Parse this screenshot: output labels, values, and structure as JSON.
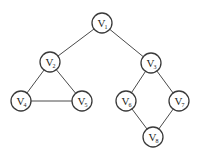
{
  "diagram": {
    "type": "undirected-graph",
    "node_radius": 10,
    "nodes": [
      {
        "id": "V1",
        "letter": "V",
        "sub": "1",
        "x": 102,
        "y": 23
      },
      {
        "id": "V2",
        "letter": "V",
        "sub": "2",
        "x": 50,
        "y": 62
      },
      {
        "id": "V3",
        "letter": "V",
        "sub": "3",
        "x": 151,
        "y": 63
      },
      {
        "id": "V4",
        "letter": "V",
        "sub": "4",
        "x": 21,
        "y": 101
      },
      {
        "id": "V5",
        "letter": "V",
        "sub": "5",
        "x": 82,
        "y": 101
      },
      {
        "id": "V6",
        "letter": "V",
        "sub": "6",
        "x": 126,
        "y": 101
      },
      {
        "id": "V7",
        "letter": "V",
        "sub": "7",
        "x": 179,
        "y": 101
      },
      {
        "id": "V8",
        "letter": "V",
        "sub": "8",
        "x": 153,
        "y": 137
      }
    ],
    "edges": [
      [
        "V1",
        "V2"
      ],
      [
        "V1",
        "V3"
      ],
      [
        "V2",
        "V4"
      ],
      [
        "V2",
        "V5"
      ],
      [
        "V4",
        "V5"
      ],
      [
        "V3",
        "V6"
      ],
      [
        "V3",
        "V7"
      ],
      [
        "V6",
        "V8"
      ],
      [
        "V7",
        "V8"
      ]
    ]
  }
}
